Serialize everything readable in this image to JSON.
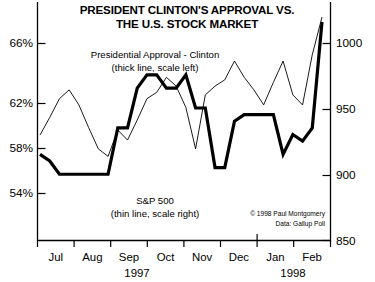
{
  "chart_data": {
    "type": "line",
    "title": "PRESIDENT CLINTON'S APPROVAL VS. THE U.S. STOCK MARKET",
    "title_line1": "PRESIDENT CLINTON'S APPROVAL VS.",
    "title_line2": "THE U.S. STOCK MARKET",
    "xlabel": "",
    "ylabel": "",
    "grid": false,
    "legend_position": "inside",
    "annotations": [
      "Presidential Approval - Clinton",
      "(thick line, scale left)",
      "S&P 500",
      "(thin line, scale right)",
      "© 1998 Paul Montgomery",
      "Data: Gallup Poll"
    ],
    "left_axis": {
      "label": "Presidential Approval (%)",
      "ticks": [
        "54%",
        "58%",
        "62%",
        "66%"
      ],
      "tick_values": [
        54,
        58,
        62,
        66
      ],
      "ylim": [
        50.5,
        68.5
      ]
    },
    "right_axis": {
      "label": "S&P 500",
      "ticks": [
        "850",
        "900",
        "950",
        "1000"
      ],
      "tick_values": [
        850,
        900,
        950,
        1000
      ],
      "ylim": [
        832,
        1022
      ]
    },
    "x_ticks": [
      "Jul",
      "Aug",
      "Sep",
      "Oct",
      "Nov",
      "Dec",
      "Jan",
      "Feb"
    ],
    "x_year_labels": [
      {
        "text": "1997",
        "at_month": "Sep"
      },
      {
        "text": "1998",
        "at_month": "Jan"
      }
    ],
    "series": [
      {
        "name": "Presidential Approval - Clinton",
        "style": "thick line",
        "axis": "left",
        "unit": "%",
        "x": [
          "Jul-1",
          "Jul-2",
          "Jul-3",
          "Jul-4",
          "Aug-1",
          "Aug-2",
          "Aug-3",
          "Aug-4",
          "Sep-1",
          "Sep-2",
          "Sep-3",
          "Sep-4",
          "Oct-1",
          "Oct-2",
          "Oct-3",
          "Oct-4",
          "Nov-1",
          "Nov-2",
          "Nov-3",
          "Nov-4",
          "Dec-1",
          "Dec-2",
          "Dec-3",
          "Dec-4",
          "Jan-1",
          "Jan-2",
          "Jan-3",
          "Jan-4",
          "Feb-1",
          "Feb-2"
        ],
        "values": [
          57.0,
          56.5,
          55.5,
          55.5,
          55.5,
          55.5,
          55.5,
          55.5,
          59.0,
          59.0,
          62.0,
          63.0,
          63.0,
          62.0,
          62.0,
          63.0,
          60.5,
          60.5,
          56.0,
          56.0,
          59.5,
          60.0,
          60.0,
          60.0,
          60.0,
          57.0,
          58.5,
          58.0,
          59.0,
          67.0
        ]
      },
      {
        "name": "S&P 500",
        "style": "thin line",
        "axis": "right",
        "unit": "index",
        "x": [
          "Jul-1",
          "Jul-2",
          "Jul-3",
          "Jul-4",
          "Aug-1",
          "Aug-2",
          "Aug-3",
          "Aug-4",
          "Sep-1",
          "Sep-2",
          "Sep-3",
          "Sep-4",
          "Oct-1",
          "Oct-2",
          "Oct-3",
          "Oct-4",
          "Nov-1",
          "Nov-2",
          "Nov-3",
          "Nov-4",
          "Dec-1",
          "Dec-2",
          "Dec-3",
          "Dec-4",
          "Jan-1",
          "Jan-2",
          "Jan-3",
          "Jan-4",
          "Feb-1",
          "Feb-2"
        ],
        "values": [
          916,
          930,
          945,
          952,
          940,
          922,
          905,
          899,
          920,
          912,
          928,
          945,
          950,
          962,
          955,
          938,
          905,
          948,
          955,
          960,
          975,
          962,
          952,
          940,
          958,
          975,
          948,
          940,
          980,
          1010
        ]
      }
    ]
  },
  "footer": {
    "copyright": "© 1998 Paul Montgomery",
    "source": "Data: Gallup Poll"
  }
}
